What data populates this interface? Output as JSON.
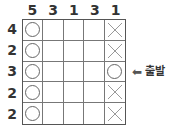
{
  "puzzle": {
    "column_clues": [
      "5",
      "3",
      "1",
      "3",
      "1"
    ],
    "row_clues": [
      "4",
      "2",
      "3",
      "2",
      "2"
    ],
    "cells": [
      [
        "circle",
        "",
        "",
        "",
        "x"
      ],
      [
        "circle",
        "",
        "",
        "",
        "x"
      ],
      [
        "circle",
        "",
        "",
        "",
        "circle"
      ],
      [
        "circle",
        "",
        "",
        "",
        "x"
      ],
      [
        "circle",
        "",
        "",
        "",
        "x"
      ]
    ],
    "start_marker": {
      "arrow": "⬅",
      "label": "출발",
      "row": 3
    }
  }
}
